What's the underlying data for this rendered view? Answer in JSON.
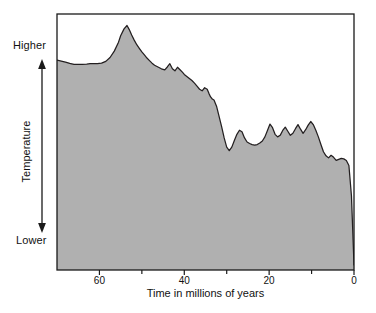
{
  "figure": {
    "background_color": "#ffffff",
    "frame_color": "#1a1a1a",
    "fill_color": "#b0b0b0",
    "line_color": "#231f20"
  },
  "axes": {
    "y": {
      "title": "Temperature",
      "high_label": "Higher",
      "low_label": "Lower",
      "arrow_name": "temperature-direction-arrow"
    },
    "x": {
      "title": "Time in millions of years",
      "major_ticks": [
        60,
        40,
        20,
        0
      ],
      "minor_ticks": [
        50,
        30,
        10
      ],
      "tick_labels": [
        "60",
        "40",
        "20",
        "0"
      ],
      "range": [
        70,
        0
      ],
      "reversed": true
    }
  },
  "chart_data": {
    "type": "area",
    "title": "",
    "subtitle": "",
    "xlabel": "Time in millions of years",
    "ylabel": "Temperature",
    "xlim": [
      70,
      0
    ],
    "ylim": [
      0,
      1
    ],
    "x_reversed": true,
    "grid": false,
    "legend": null,
    "y_axis_qualitative": true,
    "y_tick_labels": [
      "Lower",
      "Higher"
    ],
    "annotations": [],
    "series": [
      {
        "name": "Global temperature (relative)",
        "fill": "#b0b0b0",
        "stroke": "#231f20",
        "baseline": 0,
        "x": [
          70.0,
          69.0,
          68.0,
          67.0,
          66.0,
          65.0,
          64.0,
          63.0,
          62.2,
          61.5,
          60.5,
          59.5,
          58.5,
          57.5,
          56.5,
          55.5,
          55.0,
          54.2,
          53.5,
          53.0,
          52.4,
          51.8,
          51.2,
          50.6,
          50.0,
          49.4,
          48.8,
          48.2,
          47.6,
          47.0,
          46.2,
          45.4,
          44.6,
          44.0,
          43.4,
          42.8,
          42.2,
          41.6,
          41.0,
          40.4,
          40.0,
          39.4,
          38.8,
          38.2,
          37.6,
          37.0,
          36.4,
          35.8,
          35.2,
          34.6,
          34.2,
          33.8,
          33.4,
          33.0,
          32.4,
          31.8,
          31.2,
          30.6,
          30.0,
          29.4,
          28.8,
          28.2,
          27.6,
          27.0,
          26.4,
          25.8,
          25.2,
          24.6,
          24.0,
          23.4,
          22.8,
          22.2,
          21.6,
          21.0,
          20.4,
          19.8,
          19.2,
          18.6,
          18.0,
          17.4,
          16.8,
          16.2,
          15.6,
          15.0,
          14.4,
          13.8,
          13.2,
          12.6,
          12.0,
          11.4,
          10.8,
          10.2,
          9.6,
          9.0,
          8.4,
          7.8,
          7.2,
          6.6,
          6.0,
          5.4,
          4.8,
          4.2,
          3.6,
          3.0,
          2.4,
          1.8,
          1.2,
          0.6,
          0.0
        ],
        "y": [
          0.82,
          0.816,
          0.812,
          0.807,
          0.803,
          0.803,
          0.803,
          0.804,
          0.806,
          0.806,
          0.806,
          0.808,
          0.815,
          0.83,
          0.855,
          0.89,
          0.915,
          0.942,
          0.955,
          0.94,
          0.918,
          0.898,
          0.88,
          0.866,
          0.852,
          0.84,
          0.828,
          0.818,
          0.808,
          0.8,
          0.793,
          0.786,
          0.782,
          0.793,
          0.806,
          0.786,
          0.778,
          0.792,
          0.782,
          0.772,
          0.764,
          0.756,
          0.748,
          0.74,
          0.73,
          0.718,
          0.706,
          0.7,
          0.712,
          0.706,
          0.69,
          0.676,
          0.668,
          0.664,
          0.64,
          0.6,
          0.56,
          0.516,
          0.48,
          0.466,
          0.48,
          0.506,
          0.53,
          0.546,
          0.54,
          0.516,
          0.5,
          0.494,
          0.49,
          0.488,
          0.49,
          0.496,
          0.504,
          0.52,
          0.545,
          0.57,
          0.556,
          0.53,
          0.52,
          0.526,
          0.545,
          0.558,
          0.542,
          0.526,
          0.534,
          0.552,
          0.568,
          0.55,
          0.534,
          0.548,
          0.566,
          0.58,
          0.568,
          0.546,
          0.52,
          0.49,
          0.462,
          0.446,
          0.438,
          0.448,
          0.44,
          0.428,
          0.432,
          0.436,
          0.434,
          0.428,
          0.408,
          0.29,
          0.02
        ]
      }
    ]
  }
}
